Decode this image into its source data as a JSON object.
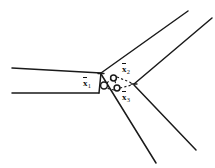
{
  "figure": {
    "type": "line-diagram",
    "width": 215,
    "height": 168,
    "background_color": "#ffffff",
    "ink_color": "#1a1a1a"
  },
  "labels": {
    "x1": {
      "symbol": "x",
      "subscript": "1",
      "overbar": true
    },
    "x2": {
      "symbol": "x",
      "subscript": "2",
      "overbar": true
    },
    "x3": {
      "symbol": "x",
      "subscript": "3",
      "overbar": true
    }
  },
  "chart_data": {
    "type": "diagram",
    "title": "",
    "nodes": [
      {
        "id": "x1",
        "label": "x1",
        "x": 104,
        "y": 85,
        "marker": "open-circle",
        "radius": 3.4
      },
      {
        "id": "x2",
        "label": "x2",
        "x": 114,
        "y": 78,
        "marker": "open-circle",
        "radius": 3.0
      },
      {
        "id": "x3",
        "label": "x3",
        "x": 117,
        "y": 88,
        "marker": "open-circle",
        "radius": 3.0
      }
    ],
    "vertices": [
      {
        "id": "v-left",
        "x": 101,
        "y": 73
      },
      {
        "id": "v-right",
        "x": 134,
        "y": 84
      }
    ],
    "dashed_edges": [
      {
        "from": "x1",
        "to": "x2"
      },
      {
        "from": "x2",
        "to": "x3"
      },
      {
        "from": "x3",
        "to": "x1"
      },
      {
        "from": "x2",
        "to": "v-right"
      },
      {
        "from": "x3",
        "to": "v-right"
      }
    ],
    "solid_branches": [
      {
        "id": "branch-upper-left",
        "from": [
          12,
          68
        ],
        "to": [
          101,
          73
        ]
      },
      {
        "id": "branch-lower-left",
        "from": [
          12,
          93
        ],
        "to": [
          101,
          73
        ]
      },
      {
        "id": "branch-upper-right",
        "from": [
          101,
          73
        ],
        "to": [
          188,
          11
        ]
      },
      {
        "id": "branch-far-upper-right",
        "from": [
          134,
          84
        ],
        "to": [
          212,
          18
        ]
      },
      {
        "id": "branch-lower-right",
        "from": [
          101,
          73
        ],
        "to": [
          156,
          163
        ]
      },
      {
        "id": "branch-far-lower-right",
        "from": [
          134,
          84
        ],
        "to": [
          196,
          150
        ]
      }
    ]
  }
}
